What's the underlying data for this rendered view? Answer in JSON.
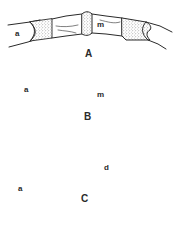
{
  "figure": {
    "panels": [
      {
        "id": "A",
        "label": "A",
        "parts": {
          "left": "a",
          "middle": "m"
        }
      },
      {
        "id": "B",
        "label": "B",
        "parts": {
          "left": "a",
          "middle": "m"
        }
      },
      {
        "id": "C",
        "label": "C",
        "parts": {
          "left": "a",
          "right": "d"
        }
      }
    ],
    "scale_bar": {
      "label": ""
    },
    "colors": {
      "ink": "#2a2a2a",
      "stipple": "#6a6a6a",
      "background": "#ffffff"
    }
  }
}
